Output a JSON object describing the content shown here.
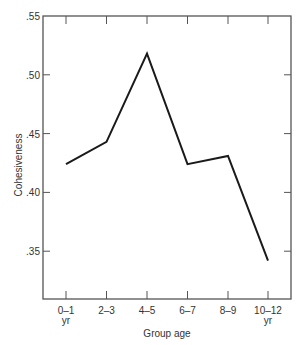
{
  "chart_data": {
    "type": "line",
    "title": "",
    "xlabel": "Group age",
    "ylabel": "Cohesiveness",
    "categories": [
      "0-1 yr",
      "2-3",
      "4-5",
      "6-7",
      "8-9",
      "10-12 yr"
    ],
    "tick_labels": [
      {
        "main": "0–1",
        "sub": "yr"
      },
      {
        "main": "2–3",
        "sub": ""
      },
      {
        "main": "4–5",
        "sub": ""
      },
      {
        "main": "6–7",
        "sub": ""
      },
      {
        "main": "8–9",
        "sub": ""
      },
      {
        "main": "10–12",
        "sub": "yr"
      }
    ],
    "series": [
      {
        "name": "Cohesiveness",
        "values": [
          0.424,
          0.443,
          0.518,
          0.424,
          0.431,
          0.342
        ]
      }
    ],
    "y_ticks": [
      0.55,
      0.5,
      0.45,
      0.4,
      0.35
    ],
    "y_tick_labels": [
      ".55",
      ".50",
      ".45",
      ".40",
      ".35"
    ],
    "ylim": [
      0.3,
      0.55
    ],
    "grid": false,
    "legend": "none",
    "colors": {
      "line": "#1a1a1a",
      "axis": "#555555",
      "text": "#333333"
    }
  }
}
